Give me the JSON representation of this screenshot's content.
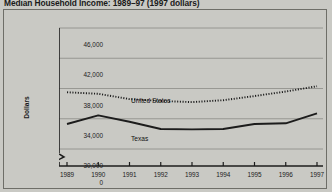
{
  "figure": {
    "title": "Median Household Income: 1989–97 (1997 dollars)"
  },
  "chart_data": {
    "type": "line",
    "title": "Median Household Income: 1989–97 (1997 dollars)",
    "xlabel": "",
    "ylabel": "Dollars",
    "x": [
      1989,
      1990,
      1991,
      1992,
      1993,
      1994,
      1995,
      1996,
      1997
    ],
    "categories": [
      "1989",
      "1990",
      "1991",
      "1992",
      "1993",
      "1994",
      "1995",
      "1996",
      "1997"
    ],
    "ylim": [
      30000,
      46000
    ],
    "yticks": [
      0,
      30000,
      34000,
      38000,
      42000,
      46000
    ],
    "ytick_labels": [
      "0",
      "30,000",
      "34,000",
      "38,000",
      "42,000",
      "46,000"
    ],
    "axis_break": true,
    "axis_break_between": [
      0,
      30000
    ],
    "grid": "horizontal",
    "legend": "inline-labels",
    "series": [
      {
        "name": "United States",
        "style": "dotted",
        "color": "#1c1c1c",
        "label_x": 1990.6,
        "label_y": 38450,
        "values": [
          37500,
          37300,
          36600,
          36350,
          36200,
          36450,
          37000,
          37600,
          38300
        ]
      },
      {
        "name": "Texas",
        "style": "solid",
        "color": "#1c1c1c",
        "label_x": 1990.6,
        "label_y": 33500,
        "values": [
          33300,
          34450,
          33600,
          32650,
          32600,
          32650,
          33300,
          33400,
          34700
        ]
      }
    ]
  }
}
